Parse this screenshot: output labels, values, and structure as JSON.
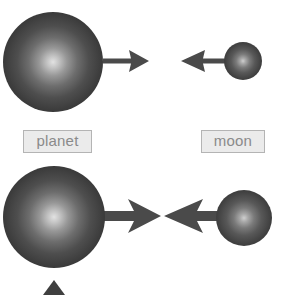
{
  "figure": {
    "background_color": "#ffffff",
    "width": 282,
    "height": 296
  },
  "palette": {
    "sphere_highlight": "#d8d8d8",
    "sphere_mid": "#6e6e6e",
    "sphere_edge": "#343434",
    "arrow_color": "#4a4a4a",
    "label_fill": "#ebebeb",
    "label_border": "#b4b4b4",
    "label_text": "#8a8a8a",
    "marker_color": "#3f3f3f"
  },
  "labels": {
    "planet": "planet",
    "moon": "moon"
  },
  "rows": [
    {
      "name": "top-row",
      "planet": {
        "name": "planet-sphere",
        "cx": 53,
        "cy": 62,
        "r": 50
      },
      "moon": {
        "name": "moon-sphere",
        "cx": 243,
        "cy": 61,
        "r": 19
      },
      "planet_arrow": {
        "name": "planet-force-arrow",
        "direction": "right",
        "tail_x": 103,
        "tip_x": 149,
        "y": 61,
        "shaft_thickness": 5,
        "head_length": 20,
        "head_half_width": 11
      },
      "moon_arrow": {
        "name": "moon-force-arrow",
        "direction": "left",
        "tail_x": 240,
        "tip_x": 181,
        "y": 61,
        "shaft_thickness": 5,
        "head_length": 20,
        "head_half_width": 11
      }
    },
    {
      "name": "bottom-row",
      "planet": {
        "name": "planet-sphere",
        "cx": 54,
        "cy": 217,
        "r": 51
      },
      "moon": {
        "name": "moon-sphere",
        "cx": 244,
        "cy": 218,
        "r": 28
      },
      "planet_arrow": {
        "name": "planet-force-arrow",
        "direction": "right",
        "tail_x": 100,
        "tip_x": 161,
        "y": 216,
        "shaft_thickness": 10,
        "head_length": 33,
        "head_half_width": 17
      },
      "moon_arrow": {
        "name": "moon-force-arrow",
        "direction": "left",
        "tail_x": 244,
        "tip_x": 164,
        "y": 216,
        "shaft_thickness": 10,
        "head_length": 33,
        "head_half_width": 17
      }
    }
  ],
  "marker": {
    "name": "center-of-mass-marker",
    "shape": "triangle-up",
    "cx": 54,
    "top_y": 280,
    "base_y": 295,
    "half_width": 11
  }
}
